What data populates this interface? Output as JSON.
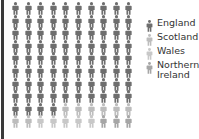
{
  "chart_data": {
    "type": "pictogram",
    "title": "",
    "grid": {
      "rows": 10,
      "cols": 10,
      "unit": "person"
    },
    "categories": [
      "England",
      "Scotland",
      "Wales",
      "Northern Ireland"
    ],
    "values": [
      84,
      8,
      5,
      3
    ],
    "colors": [
      "#6e6e6e",
      "#bdbdbd",
      "#c8c8c8",
      "#a6a6a6"
    ],
    "legend_position": "right"
  },
  "legend": {
    "items": [
      {
        "label": "England",
        "color": "#6e6e6e"
      },
      {
        "label": "Scotland",
        "color": "#bdbdbd"
      },
      {
        "label": "Wales",
        "color": "#c8c8c8"
      },
      {
        "label": "Northern\nIreland",
        "color": "#a6a6a6"
      }
    ]
  }
}
